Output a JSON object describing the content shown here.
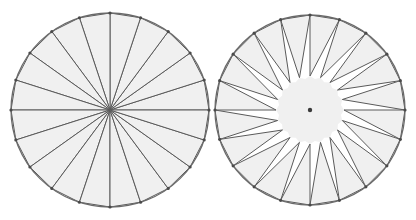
{
  "figure": {
    "background_color": "#ffffff",
    "fill_color": "#f0f0f0",
    "stroke_color": "#5a5a5a",
    "rim_color": "#6a6a6a",
    "vertex_color": "#4a4a4a",
    "center_dot_color": "#3a3a3a",
    "sector_count": 20,
    "sector_angle_degrees": 18,
    "canvas": {
      "width": 416,
      "height": 220
    }
  },
  "panels": [
    {
      "id": "left-panel",
      "label": "Sectors meeting at center",
      "center_x": 110,
      "center_y": 110,
      "radius_x": 99,
      "radius_y": 97,
      "apex_radius": 0,
      "apex_offset_degrees": 0,
      "has_center_dot": false,
      "has_vertex_dots": true,
      "inner_hub_radius": 0
    },
    {
      "id": "right-panel",
      "label": "Sectors rotated about their own apexes",
      "center_x": 310,
      "center_y": 110,
      "radius_x": 95,
      "radius_y": 95,
      "apex_radius": 34,
      "apex_offset_degrees": 9,
      "has_center_dot": true,
      "has_vertex_dots": true,
      "inner_hub_radius": 34
    }
  ]
}
